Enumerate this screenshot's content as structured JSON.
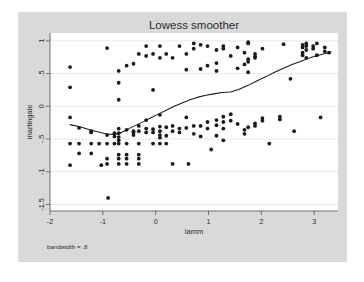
{
  "figure": {
    "panel_bg": "#d9d9d9",
    "plot_bg": "#ffffff",
    "grid_color": "#e8e8e8",
    "axis_color": "#6e6e6e",
    "marker_color": "#1a1a1a",
    "line_color": "#1a1a1a",
    "note": "bandwidth = .8"
  },
  "chart_data": {
    "type": "scatter",
    "title": "Lowess smoother",
    "xlabel": "lamm",
    "ylabel": "martingale",
    "xlim": [
      -2.0,
      3.45
    ],
    "ylim": [
      -1.6,
      1.12
    ],
    "grid": true,
    "legend": "none",
    "annotations": [
      "bandwidth = .8"
    ],
    "xticks": [
      -2,
      -1,
      0,
      1,
      2,
      3
    ],
    "xtick_labels": [
      "-2",
      "-1",
      "0",
      "1",
      "2",
      "3"
    ],
    "yticks": [
      1,
      0.5,
      0,
      -0.5,
      -1,
      -1.5
    ],
    "ytick_labels": [
      "1",
      ".5",
      "0",
      "-.5",
      "-1",
      "-1.5"
    ],
    "series": [
      {
        "name": "martingale residuals",
        "type": "scatter",
        "marker": "circle",
        "points": [
          [
            -1.62,
            0.6
          ],
          [
            -1.62,
            0.29
          ],
          [
            -1.62,
            -0.17
          ],
          [
            -1.62,
            -0.57
          ],
          [
            -1.62,
            -0.9
          ],
          [
            -1.45,
            -0.33
          ],
          [
            -1.45,
            -0.57
          ],
          [
            -1.45,
            -0.72
          ],
          [
            -1.22,
            -0.38
          ],
          [
            -1.22,
            -0.4
          ],
          [
            -1.22,
            -0.57
          ],
          [
            -1.22,
            -0.72
          ],
          [
            -1.07,
            -0.57
          ],
          [
            -1.03,
            -0.9
          ],
          [
            -0.92,
            0.89
          ],
          [
            -0.92,
            -0.44
          ],
          [
            -0.92,
            -0.57
          ],
          [
            -0.92,
            -0.8
          ],
          [
            -0.92,
            -0.88
          ],
          [
            -0.9,
            -1.4
          ],
          [
            -0.78,
            -0.41
          ],
          [
            -0.78,
            -0.46
          ],
          [
            -0.78,
            -0.57
          ],
          [
            -0.7,
            0.54
          ],
          [
            -0.7,
            0.36
          ],
          [
            -0.7,
            0.1
          ],
          [
            -0.7,
            -0.34
          ],
          [
            -0.7,
            -0.41
          ],
          [
            -0.7,
            -0.47
          ],
          [
            -0.7,
            -0.52
          ],
          [
            -0.7,
            -0.57
          ],
          [
            -0.7,
            -0.74
          ],
          [
            -0.7,
            -0.8
          ],
          [
            -0.7,
            -0.88
          ],
          [
            -0.55,
            0.62
          ],
          [
            -0.55,
            -0.36
          ],
          [
            -0.55,
            -0.57
          ],
          [
            -0.55,
            -0.74
          ],
          [
            -0.55,
            -0.8
          ],
          [
            -0.55,
            -0.88
          ],
          [
            -0.42,
            0.65
          ],
          [
            -0.42,
            -0.38
          ],
          [
            -0.42,
            -0.4
          ],
          [
            -0.42,
            -0.44
          ],
          [
            -0.32,
            0.8
          ],
          [
            -0.32,
            -0.3
          ],
          [
            -0.32,
            -0.38
          ],
          [
            -0.32,
            -0.57
          ],
          [
            -0.32,
            -0.74
          ],
          [
            -0.32,
            -0.8
          ],
          [
            -0.32,
            -0.88
          ],
          [
            -0.18,
            0.92
          ],
          [
            -0.18,
            0.77
          ],
          [
            -0.18,
            -0.21
          ],
          [
            -0.18,
            -0.34
          ],
          [
            -0.18,
            -0.4
          ],
          [
            -0.05,
            0.8
          ],
          [
            -0.05,
            0.25
          ],
          [
            -0.05,
            -0.35
          ],
          [
            -0.05,
            -0.4
          ],
          [
            -0.05,
            -0.57
          ],
          [
            0.08,
            0.92
          ],
          [
            0.08,
            0.74
          ],
          [
            0.08,
            -0.13
          ],
          [
            0.08,
            -0.31
          ],
          [
            0.08,
            -0.38
          ],
          [
            0.08,
            -0.44
          ],
          [
            0.08,
            -0.48
          ],
          [
            0.08,
            -0.57
          ],
          [
            0.2,
            0.8
          ],
          [
            0.2,
            -0.32
          ],
          [
            0.2,
            -0.45
          ],
          [
            0.2,
            -0.57
          ],
          [
            0.32,
            0.74
          ],
          [
            0.32,
            -0.3
          ],
          [
            0.32,
            -0.38
          ],
          [
            0.32,
            -0.88
          ],
          [
            0.45,
            0.92
          ],
          [
            0.45,
            -0.34
          ],
          [
            0.45,
            -0.4
          ],
          [
            0.58,
            0.8
          ],
          [
            0.58,
            0.56
          ],
          [
            0.58,
            -0.17
          ],
          [
            0.58,
            -0.33
          ],
          [
            0.62,
            -0.88
          ],
          [
            0.72,
            0.96
          ],
          [
            0.72,
            0.88
          ],
          [
            0.72,
            -0.3
          ],
          [
            0.72,
            -0.42
          ],
          [
            0.85,
            0.94
          ],
          [
            0.85,
            0.57
          ],
          [
            0.85,
            -0.3
          ],
          [
            0.85,
            -0.46
          ],
          [
            0.98,
            0.92
          ],
          [
            0.98,
            0.62
          ],
          [
            0.98,
            -0.24
          ],
          [
            0.98,
            -0.34
          ],
          [
            1.05,
            -0.66
          ],
          [
            1.15,
            0.86
          ],
          [
            1.15,
            0.66
          ],
          [
            1.15,
            0.54
          ],
          [
            1.15,
            -0.21
          ],
          [
            1.15,
            -0.29
          ],
          [
            1.15,
            -0.45
          ],
          [
            1.28,
            0.92
          ],
          [
            1.28,
            0.88
          ],
          [
            1.28,
            -0.16
          ],
          [
            1.28,
            -0.24
          ],
          [
            1.28,
            -0.34
          ],
          [
            1.28,
            -0.52
          ],
          [
            1.42,
            0.77
          ],
          [
            1.42,
            -0.12
          ],
          [
            1.42,
            -0.22
          ],
          [
            1.55,
            0.9
          ],
          [
            1.55,
            0.58
          ],
          [
            1.55,
            -0.27
          ],
          [
            1.68,
            0.82
          ],
          [
            1.68,
            0.64
          ],
          [
            1.68,
            -0.36
          ],
          [
            1.68,
            -0.42
          ],
          [
            1.75,
            0.98
          ],
          [
            1.75,
            0.96
          ],
          [
            1.75,
            0.72
          ],
          [
            1.75,
            0.68
          ],
          [
            1.75,
            0.52
          ],
          [
            1.75,
            -0.32
          ],
          [
            1.88,
            0.8
          ],
          [
            1.88,
            0.76
          ],
          [
            1.88,
            0.74
          ],
          [
            1.88,
            -0.26
          ],
          [
            1.88,
            -0.3
          ],
          [
            2.02,
            0.88
          ],
          [
            2.02,
            -0.18
          ],
          [
            2.02,
            -0.22
          ],
          [
            2.15,
            -0.57
          ],
          [
            2.35,
            -0.16
          ],
          [
            2.35,
            -0.2
          ],
          [
            2.42,
            0.95
          ],
          [
            2.55,
            0.42
          ],
          [
            2.62,
            -0.38
          ],
          [
            2.78,
            0.94
          ],
          [
            2.78,
            0.9
          ],
          [
            2.78,
            0.82
          ],
          [
            2.78,
            0.78
          ],
          [
            2.85,
            0.96
          ],
          [
            2.85,
            0.92
          ],
          [
            2.85,
            0.86
          ],
          [
            2.85,
            0.74
          ],
          [
            2.98,
            0.92
          ],
          [
            2.98,
            0.88
          ],
          [
            3.05,
            0.96
          ],
          [
            3.05,
            0.78
          ],
          [
            3.12,
            -0.17
          ],
          [
            3.2,
            0.9
          ],
          [
            3.2,
            0.84
          ],
          [
            3.28,
            0.82
          ]
        ]
      },
      {
        "name": "lowess smooth",
        "type": "line",
        "points": [
          [
            -1.62,
            -0.28
          ],
          [
            -1.45,
            -0.31
          ],
          [
            -1.28,
            -0.35
          ],
          [
            -1.1,
            -0.39
          ],
          [
            -0.95,
            -0.42
          ],
          [
            -0.8,
            -0.43
          ],
          [
            -0.7,
            -0.42
          ],
          [
            -0.6,
            -0.38
          ],
          [
            -0.48,
            -0.33
          ],
          [
            -0.35,
            -0.28
          ],
          [
            -0.22,
            -0.23
          ],
          [
            -0.1,
            -0.18
          ],
          [
            0.05,
            -0.12
          ],
          [
            0.2,
            -0.06
          ],
          [
            0.35,
            0.0
          ],
          [
            0.5,
            0.05
          ],
          [
            0.65,
            0.1
          ],
          [
            0.8,
            0.14
          ],
          [
            0.95,
            0.17
          ],
          [
            1.1,
            0.19
          ],
          [
            1.25,
            0.21
          ],
          [
            1.42,
            0.22
          ],
          [
            1.58,
            0.26
          ],
          [
            1.75,
            0.32
          ],
          [
            1.92,
            0.39
          ],
          [
            2.08,
            0.45
          ],
          [
            2.25,
            0.52
          ],
          [
            2.42,
            0.58
          ],
          [
            2.58,
            0.64
          ],
          [
            2.75,
            0.69
          ],
          [
            2.92,
            0.74
          ],
          [
            3.08,
            0.78
          ],
          [
            3.22,
            0.81
          ],
          [
            3.32,
            0.83
          ]
        ]
      }
    ]
  }
}
